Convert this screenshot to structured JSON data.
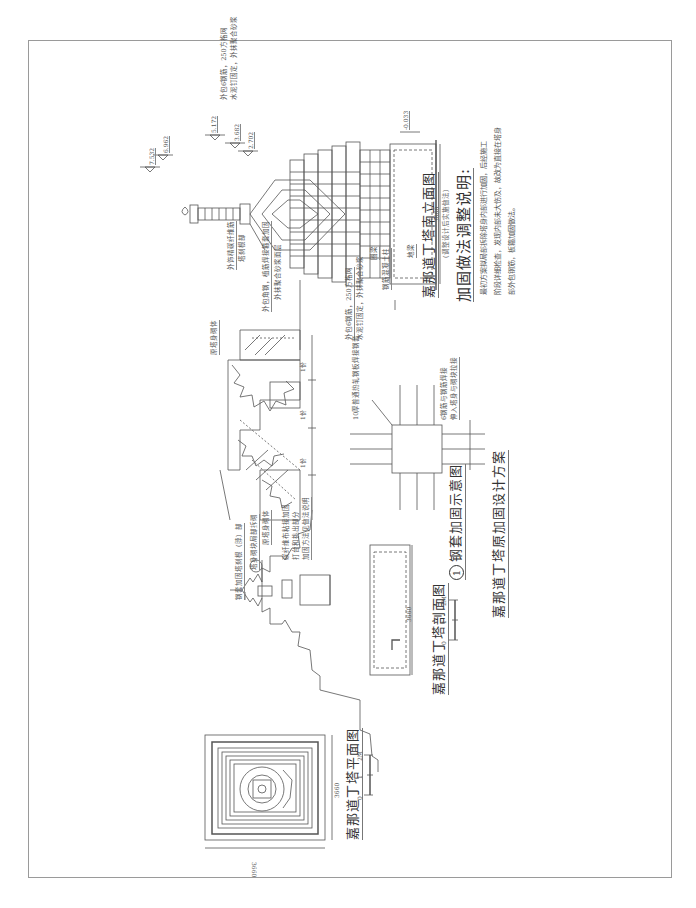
{
  "document": {
    "main_title": "嘉那道丁塔原加固设计方案",
    "drawings": {
      "south_elevation": {
        "title": "嘉那道丁塔南立面图",
        "subtitle": "（调整设计后实施做法）",
        "elevations": [
          "7.532",
          "6.962",
          "5.172",
          "3.682",
          "2.702",
          "-0.033"
        ],
        "annotations": [
          "外饰精碳纤维筋",
          "塔刹根部",
          "外包角钢，植筋焊接箍套加固",
          "外抹聚合砂浆面层",
          "外包6钢筋，250方格网",
          "水泥钉固定，外抹聚合砂浆",
          "外包6钢筋，250方格网",
          "水泥钉固定，外抹聚合砂浆",
          "圈梁",
          "钢筋混凝土柱",
          "地梁"
        ],
        "dimension": "3660"
      },
      "reinforcement_notes": {
        "heading": "加固做法调整说明:",
        "lines": [
          "最初方案拟局部拆除塔身内部进行加固，后经施工",
          "阶段详细检查，发现内部未大伤及，故改为直接在塔身",
          "部外包钢筋，板箍加固做法。"
        ]
      },
      "steel_jacket_detail": {
        "title": "钢套加固示意图",
        "number": "1",
        "annotations": [
          "原塔身砌体",
          "塔身砌块局部拆砌",
          "原塔身砌体",
          "10厚普通热轧钢板焊接钢套",
          "6钢筋与钢筋焊接",
          "伸入塔身与砌块拉接"
        ],
        "dimensions": [
          "1份",
          "1份",
          "1份",
          "1份"
        ]
      },
      "section": {
        "title": "嘉那道丁塔剖面图",
        "annotations": [
          "钢套加固塔刹根（脖）部",
          "碳纤维布粘接加固",
          "打台和挑出部分",
          "加固方法见做法说明"
        ],
        "callout": "1",
        "dimension": "3660",
        "scale": [
          "0",
          "1",
          "2M"
        ]
      },
      "plan": {
        "title": "嘉那道丁塔平面图",
        "dimensions": [
          "3660",
          "3660"
        ],
        "scale": [
          "0",
          "1",
          "2M"
        ]
      }
    }
  }
}
